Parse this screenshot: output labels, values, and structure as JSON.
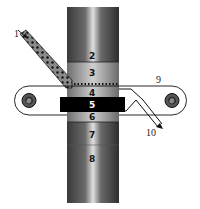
{
  "diagram": {
    "type": "apparatus-schematic",
    "labels": {
      "feed_tube": "1",
      "section_2": "2",
      "section_3": "3",
      "section_4": "4",
      "section_5": "5",
      "section_6": "6",
      "section_7": "7",
      "section_8": "8",
      "belt": "9",
      "outlet": "10"
    },
    "colors": {
      "column_dark": "#2a2a2a",
      "column_highlight": "#d8d8d8",
      "band": "#000000",
      "line": "#111111",
      "background": "#ffffff"
    }
  }
}
